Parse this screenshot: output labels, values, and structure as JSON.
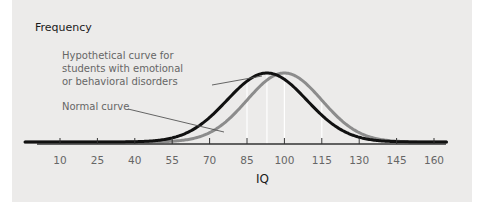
{
  "chart_data": {
    "type": "line",
    "title": "",
    "xlabel": "IQ",
    "ylabel": "Frequency",
    "xlim": [
      -4,
      165
    ],
    "x_ticks": [
      10,
      25,
      40,
      55,
      70,
      85,
      100,
      115,
      130,
      145,
      160
    ],
    "x_tick_labels": [
      "10",
      "25",
      "40",
      "55",
      "70",
      "85",
      "100",
      "115",
      "130",
      "145",
      "160"
    ],
    "grid": false,
    "reference_lines_x": [
      85,
      93,
      100,
      115,
      130
    ],
    "series": [
      {
        "name": "Normal curve",
        "distribution": "normal",
        "mean": 100,
        "sd": 15,
        "relative_peak": 1.0,
        "color": "#8c8c8c"
      },
      {
        "name": "Hypothetical curve for students with emotional or behavioral disorders",
        "distribution": "normal",
        "mean": 93,
        "sd": 16,
        "relative_peak": 1.0,
        "color": "#111111"
      }
    ],
    "annotations": [
      {
        "text_lines": [
          "Hypothetical curve for",
          "students with emotional",
          "or behavioral disorders"
        ],
        "points_to_series": 1,
        "target_x": 80
      },
      {
        "text_lines": [
          "Normal curve"
        ],
        "points_to_series": 0,
        "target_x": 72
      }
    ],
    "colors": {
      "panel_background": "#ecebea",
      "axis": "#333333",
      "reference_line": "#ffffff"
    }
  }
}
